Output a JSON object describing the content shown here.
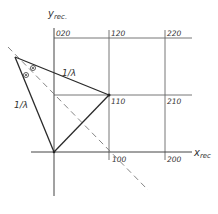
{
  "axes": {
    "y_label": "y",
    "y_sub": "rec.",
    "x_label": "x",
    "x_sub": "rec"
  },
  "grid_points": [
    {
      "label": "020",
      "x": 56,
      "y": 36
    },
    {
      "label": "120",
      "x": 111,
      "y": 36
    },
    {
      "label": "220",
      "x": 167,
      "y": 36
    },
    {
      "label": "110",
      "x": 111,
      "y": 104
    },
    {
      "label": "210",
      "x": 167,
      "y": 104
    },
    {
      "label": "100",
      "x": 112,
      "y": 162
    },
    {
      "label": "200",
      "x": 167,
      "y": 162
    }
  ],
  "annotations": {
    "upper_edge_label": "1/λ",
    "left_edge_label": "1/λ",
    "marker_symbol": "⊙"
  },
  "colors": {
    "line": "#2a2a2a",
    "grid": "#555555",
    "dashed": "#777777"
  }
}
